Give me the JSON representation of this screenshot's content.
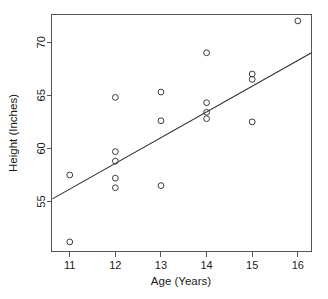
{
  "chart_data": {
    "type": "scatter",
    "title": "",
    "xlabel": "Age (Years)",
    "ylabel": "Height (Inches)",
    "xlim": [
      10.6,
      16.3
    ],
    "ylim": [
      50.3,
      72.6
    ],
    "xticks": [
      11,
      12,
      13,
      14,
      15,
      16
    ],
    "xtick_labels": [
      "11",
      "12",
      "13",
      "14",
      "15",
      "16"
    ],
    "yticks": [
      55,
      60,
      65,
      70
    ],
    "ytick_labels": [
      "55",
      "60",
      "65",
      "70"
    ],
    "grid": false,
    "legend": null,
    "marker": "open-circle",
    "point_color": "#3a3a3a",
    "line_color": "#2b2b2b",
    "points": [
      {
        "x": 11,
        "y": 57.5
      },
      {
        "x": 11,
        "y": 51.2
      },
      {
        "x": 12,
        "y": 64.8
      },
      {
        "x": 12,
        "y": 59.7
      },
      {
        "x": 12,
        "y": 58.8
      },
      {
        "x": 12,
        "y": 57.2
      },
      {
        "x": 12,
        "y": 56.3
      },
      {
        "x": 13,
        "y": 65.3
      },
      {
        "x": 13,
        "y": 62.6
      },
      {
        "x": 13,
        "y": 56.5
      },
      {
        "x": 14,
        "y": 69.0
      },
      {
        "x": 14,
        "y": 64.3
      },
      {
        "x": 14,
        "y": 63.4
      },
      {
        "x": 14,
        "y": 62.8
      },
      {
        "x": 15,
        "y": 67.0
      },
      {
        "x": 15,
        "y": 66.5
      },
      {
        "x": 15,
        "y": 62.5
      },
      {
        "x": 16,
        "y": 72.0
      }
    ],
    "fit_line": {
      "label": "regression-line",
      "x_start": 10.62,
      "y_start": 55.25,
      "x_end": 16.3,
      "y_end": 69.0
    }
  }
}
